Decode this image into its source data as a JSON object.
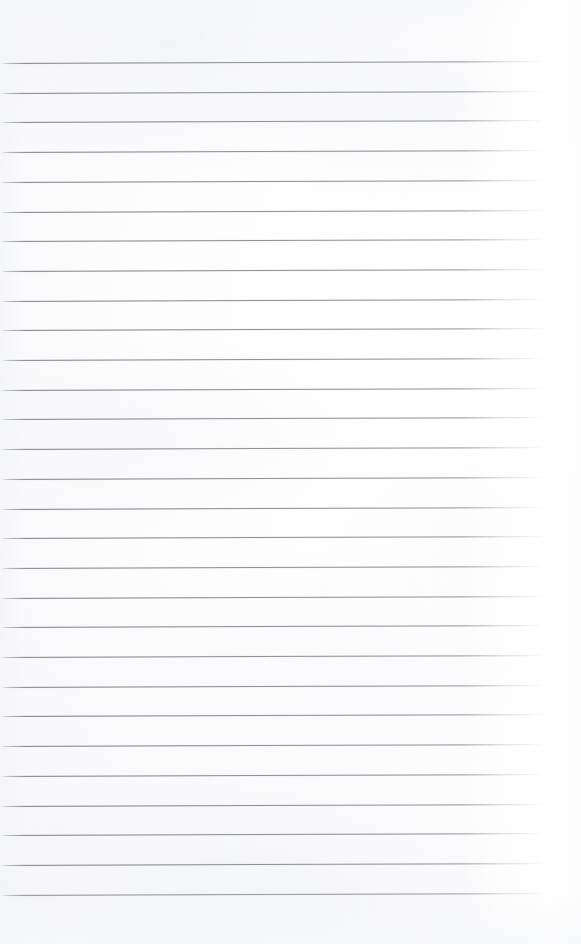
{
  "document": {
    "kind": "scanned-ruled-notebook-page",
    "title": "Blank Lined Notebook Page",
    "content_text": "",
    "handwriting_present": "no",
    "page_width_px": 581,
    "page_height_px": 944
  },
  "paper": {
    "background_color": "#fbfbfc",
    "highlight_color": "#ffffff",
    "shadow_color": "#f2f3f5",
    "right_edge_color": "#fdfdfe"
  },
  "ruling": {
    "line_color": "#888d95",
    "line_color_light": "#b0b4ba",
    "line_thickness_px": 1,
    "line_count": 29,
    "first_line_y_px": 63,
    "line_spacing_px": 29.7,
    "line_start_x_px": 2,
    "line_end_x_px": 542,
    "line_length_px": 540,
    "slant_degrees": -0.21,
    "top_margin_px": 63,
    "bottom_margin_px": 50,
    "right_margin_px": 39,
    "lines": [
      {
        "index": 1,
        "y": 63.0,
        "x_start": 2,
        "x_end": 542
      },
      {
        "index": 2,
        "y": 92.7,
        "x_start": 2,
        "x_end": 542
      },
      {
        "index": 3,
        "y": 122.4,
        "x_start": 2,
        "x_end": 542
      },
      {
        "index": 4,
        "y": 152.1,
        "x_start": 2,
        "x_end": 542
      },
      {
        "index": 5,
        "y": 181.8,
        "x_start": 2,
        "x_end": 542
      },
      {
        "index": 6,
        "y": 211.5,
        "x_start": 2,
        "x_end": 542
      },
      {
        "index": 7,
        "y": 241.2,
        "x_start": 2,
        "x_end": 542
      },
      {
        "index": 8,
        "y": 270.9,
        "x_start": 2,
        "x_end": 542
      },
      {
        "index": 9,
        "y": 300.6,
        "x_start": 2,
        "x_end": 542
      },
      {
        "index": 10,
        "y": 330.3,
        "x_start": 2,
        "x_end": 542
      },
      {
        "index": 11,
        "y": 360.0,
        "x_start": 2,
        "x_end": 542
      },
      {
        "index": 12,
        "y": 389.7,
        "x_start": 2,
        "x_end": 542
      },
      {
        "index": 13,
        "y": 419.4,
        "x_start": 2,
        "x_end": 542
      },
      {
        "index": 14,
        "y": 449.1,
        "x_start": 2,
        "x_end": 542
      },
      {
        "index": 15,
        "y": 478.8,
        "x_start": 2,
        "x_end": 542
      },
      {
        "index": 16,
        "y": 508.5,
        "x_start": 2,
        "x_end": 542
      },
      {
        "index": 17,
        "y": 538.2,
        "x_start": 2,
        "x_end": 542
      },
      {
        "index": 18,
        "y": 567.9,
        "x_start": 2,
        "x_end": 542
      },
      {
        "index": 19,
        "y": 597.6,
        "x_start": 2,
        "x_end": 542
      },
      {
        "index": 20,
        "y": 627.3,
        "x_start": 2,
        "x_end": 542
      },
      {
        "index": 21,
        "y": 657.0,
        "x_start": 2,
        "x_end": 542
      },
      {
        "index": 22,
        "y": 686.7,
        "x_start": 2,
        "x_end": 542
      },
      {
        "index": 23,
        "y": 716.4,
        "x_start": 2,
        "x_end": 542
      },
      {
        "index": 24,
        "y": 746.1,
        "x_start": 2,
        "x_end": 542
      },
      {
        "index": 25,
        "y": 775.8,
        "x_start": 2,
        "x_end": 542
      },
      {
        "index": 26,
        "y": 805.5,
        "x_start": 2,
        "x_end": 542
      },
      {
        "index": 27,
        "y": 835.2,
        "x_start": 2,
        "x_end": 542
      },
      {
        "index": 28,
        "y": 864.9,
        "x_start": 2,
        "x_end": 542
      },
      {
        "index": 29,
        "y": 894.6,
        "x_start": 2,
        "x_end": 542
      }
    ]
  }
}
